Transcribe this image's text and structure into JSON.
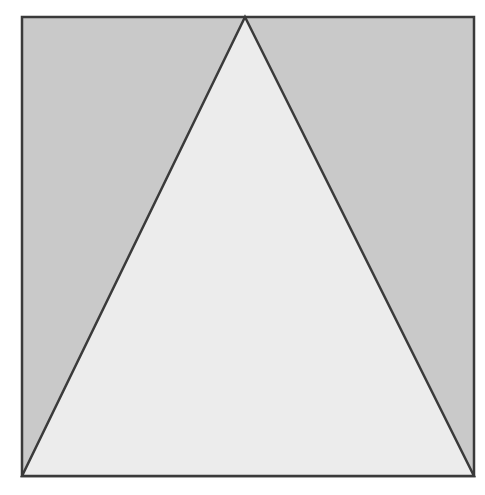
{
  "figure": {
    "type": "geometric-diagram",
    "square": {
      "x": 22,
      "y": 17,
      "width": 452,
      "height": 459,
      "fill": "#c9c9c9",
      "stroke": "#3a3a3a",
      "stroke_width": 2.5
    },
    "triangle": {
      "points": [
        [
          245,
          17
        ],
        [
          22,
          476
        ],
        [
          474,
          476
        ]
      ],
      "fill": "#ececec",
      "stroke": "#3a3a3a",
      "stroke_width": 2.5
    }
  },
  "caption": {
    "text": "Figure 1.1 (cropped)"
  }
}
